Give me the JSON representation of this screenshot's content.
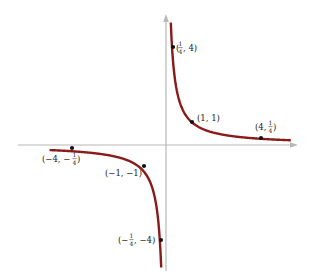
{
  "chart_data": {
    "type": "line",
    "title": "",
    "function": "y = 1/x",
    "xlabel": "",
    "ylabel": "",
    "grid": false,
    "legend": null,
    "xlim": [
      -4.8,
      5.2
    ],
    "ylim": [
      -5.1,
      5.3
    ],
    "series": [
      {
        "name": "y = 1/x (x > 0)",
        "color": "#8b1a1a",
        "x": [
          0.2,
          0.25,
          0.5,
          1,
          2,
          3,
          4,
          5
        ],
        "y": [
          5,
          4,
          2,
          1,
          0.5,
          0.333,
          0.25,
          0.2
        ]
      },
      {
        "name": "y = 1/x (x < 0)",
        "color": "#8b1a1a",
        "x": [
          -4.8,
          -4,
          -3,
          -2,
          -1,
          -0.5,
          -0.25,
          -0.2
        ],
        "y": [
          -0.208,
          -0.25,
          -0.333,
          -0.5,
          -1,
          -2,
          -4,
          -5
        ]
      }
    ],
    "annotations": [
      {
        "x": 0.25,
        "y": 4,
        "label_parts": [
          "(",
          "1/4",
          ", 4)"
        ],
        "text": "(1/4, 4)"
      },
      {
        "x": 1,
        "y": 1,
        "label_parts": [
          "(1, 1)"
        ],
        "text": "(1, 1)"
      },
      {
        "x": 4,
        "y": 0.25,
        "label_parts": [
          "(4, ",
          "1/4",
          ")"
        ],
        "text": "(4, 1/4)"
      },
      {
        "x": -4,
        "y": -0.25,
        "label_parts": [
          "(−4, −",
          "1/4",
          ")"
        ],
        "text": "(−4, −1/4)"
      },
      {
        "x": -1,
        "y": -1,
        "label_parts": [
          "(−1, −1)"
        ],
        "text": "(−1, −1)"
      },
      {
        "x": -0.25,
        "y": -4,
        "label_parts": [
          "(−",
          "1/4",
          ", −4)"
        ],
        "text": "(−1/4, −4)"
      }
    ]
  },
  "colors": {
    "curve": "#8b1a1a",
    "axis": "#b8b8b8",
    "point": "#111111",
    "text": "#222222"
  },
  "labels": {
    "p1": "(1/4, 4)",
    "p2": "(1, 1)",
    "p3": "(4, 1/4)",
    "p4": "(−4, −1/4)",
    "p5": "(−1, −1)",
    "p6": "(−1/4, −4)"
  }
}
